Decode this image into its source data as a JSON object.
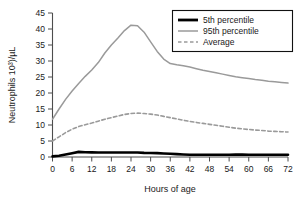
{
  "chart_data": {
    "type": "line",
    "title": "",
    "xlabel": "Hours of age",
    "ylabel": "Neutrophils 10³)/µL",
    "xlim": [
      0,
      72
    ],
    "ylim": [
      0,
      45
    ],
    "xticks": [
      0,
      6,
      12,
      18,
      24,
      30,
      36,
      42,
      48,
      54,
      60,
      66,
      72
    ],
    "yticks": [
      0,
      5,
      10,
      15,
      20,
      25,
      30,
      35,
      40,
      45
    ],
    "xtick_labels": [
      "0",
      "6",
      "12",
      "18",
      "24",
      "30",
      "36",
      "42",
      "48",
      "54",
      "60",
      "66",
      "72"
    ],
    "ytick_labels": [
      "0",
      "5",
      "10",
      "15",
      "20",
      "25",
      "30",
      "35",
      "40",
      "45"
    ],
    "grid": false,
    "legend_position": "top-right",
    "x": [
      0,
      2,
      4,
      6,
      8,
      10,
      12,
      14,
      16,
      18,
      20,
      22,
      24,
      26,
      28,
      30,
      32,
      34,
      36,
      38,
      40,
      42,
      44,
      46,
      48,
      50,
      52,
      54,
      56,
      58,
      60,
      62,
      64,
      66,
      68,
      70,
      72
    ],
    "series": [
      {
        "name": "5th percentile",
        "color": "#000000",
        "style": "solid",
        "width": 2.6,
        "values": [
          0.2,
          0.4,
          0.8,
          1.2,
          1.6,
          1.5,
          1.45,
          1.4,
          1.4,
          1.4,
          1.4,
          1.4,
          1.4,
          1.4,
          1.3,
          1.25,
          1.2,
          1.1,
          1.0,
          0.9,
          0.8,
          0.7,
          0.7,
          0.7,
          0.7,
          0.7,
          0.7,
          0.7,
          0.75,
          0.75,
          0.7,
          0.7,
          0.7,
          0.7,
          0.7,
          0.7,
          0.7
        ]
      },
      {
        "name": "95th percentile",
        "color": "#9a9a9a",
        "style": "solid",
        "width": 1.5,
        "values": [
          11.8,
          15.0,
          18.0,
          20.6,
          23.0,
          25.2,
          27.2,
          29.5,
          32.5,
          35.0,
          37.2,
          39.5,
          41.2,
          41.0,
          39.0,
          36.0,
          33.0,
          30.6,
          29.2,
          28.8,
          28.5,
          28.1,
          27.6,
          27.1,
          26.7,
          26.3,
          25.9,
          25.5,
          25.1,
          24.8,
          24.5,
          24.2,
          24.0,
          23.7,
          23.5,
          23.3,
          23.1
        ]
      },
      {
        "name": "Average",
        "color": "#9a9a9a",
        "style": "dashed",
        "width": 1.6,
        "values": [
          5.0,
          6.3,
          7.6,
          8.7,
          9.5,
          10.1,
          10.6,
          11.2,
          11.8,
          12.3,
          12.8,
          13.3,
          13.6,
          13.7,
          13.6,
          13.4,
          13.1,
          12.7,
          12.3,
          11.9,
          11.5,
          11.1,
          10.8,
          10.5,
          10.2,
          9.9,
          9.6,
          9.3,
          9.0,
          8.8,
          8.6,
          8.4,
          8.3,
          8.1,
          8.0,
          7.9,
          7.8
        ]
      }
    ]
  },
  "legend": {
    "items": [
      {
        "label": "5th percentile"
      },
      {
        "label": "95th percentile"
      },
      {
        "label": "Average"
      }
    ]
  }
}
